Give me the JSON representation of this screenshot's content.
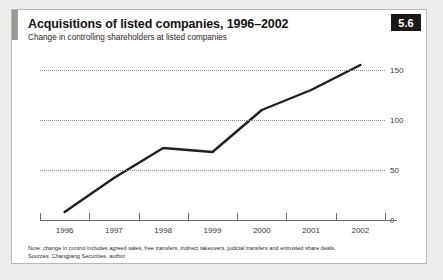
{
  "figure": {
    "number": "5.6",
    "title": "Acquisitions of listed companies, 1996–2002",
    "subtitle": "Change in controlling shareholders at listed companies",
    "note": "Note: change in control includes agreed sales, free transfers, indirect takeovers, judicial transfers and entrusted share deals.",
    "source": "Sources: Changjiang Securities, author"
  },
  "colors": {
    "badge_bg": "#1b1815",
    "badge_text": "#ffffff",
    "accent_bar": "#9c9a97",
    "line": "#231f1c",
    "grid": "#8f8d8a",
    "axis": "#6e6c69",
    "card_bg": "#ffffff",
    "page_bg": "#edecea"
  },
  "chart_data": {
    "type": "line",
    "title": "Acquisitions of listed companies, 1996–2002",
    "subtitle": "Change in controlling shareholders at listed companies",
    "xlabel": "",
    "ylabel": "",
    "categories": [
      "1996",
      "1997",
      "1998",
      "1999",
      "2000",
      "2001",
      "2002"
    ],
    "values": [
      8,
      42,
      72,
      68,
      110,
      130,
      155
    ],
    "series": [
      {
        "name": "Change in controlling shareholders",
        "values": [
          8,
          42,
          72,
          68,
          110,
          130,
          155
        ]
      }
    ],
    "ylim": [
      0,
      167
    ],
    "yticks": [
      0,
      50,
      100,
      150
    ],
    "ytick_labels": [
      "0",
      "50",
      "100",
      "150"
    ],
    "grid": "horizontal-dotted",
    "legend": "none"
  }
}
